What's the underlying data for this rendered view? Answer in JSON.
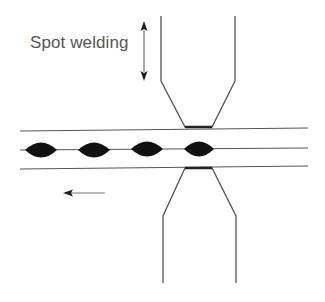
{
  "diagram": {
    "title_label": "Spot welding",
    "colors": {
      "line": "#555555",
      "nugget": "#111111",
      "text": "#555555"
    },
    "elements": {
      "upper_electrode": "electrode pressing from above",
      "lower_electrode": "electrode pressing from below",
      "sheets": "two overlapping metal sheets",
      "weld_nuggets": 4,
      "motion_arrow": "left",
      "force_arrow": "up-down"
    }
  }
}
